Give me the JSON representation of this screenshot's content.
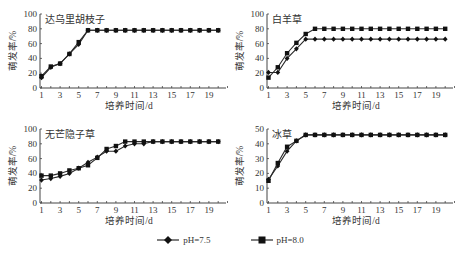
{
  "chart_data": [
    {
      "type": "line",
      "title": "达乌里胡枝子",
      "xlabel": "培养时间/d",
      "ylabel": "萌发率/%",
      "x": [
        1,
        2,
        3,
        4,
        5,
        6,
        7,
        8,
        9,
        10,
        11,
        12,
        13,
        14,
        15,
        16,
        17,
        18,
        19,
        20
      ],
      "xticks": [
        1,
        3,
        5,
        7,
        9,
        11,
        13,
        15,
        17,
        19
      ],
      "yticks": [
        0,
        20,
        40,
        60,
        80,
        100
      ],
      "ylim": [
        0,
        100
      ],
      "series": [
        {
          "name": "pH=7.5",
          "marker": "diamond",
          "values": [
            14,
            28,
            33,
            46,
            59,
            78,
            78,
            78,
            78,
            78,
            78,
            78,
            78,
            78,
            78,
            78,
            78,
            78,
            78,
            78
          ]
        },
        {
          "name": "pH=8.0",
          "marker": "square",
          "values": [
            16,
            29,
            33,
            46,
            62,
            78,
            78,
            78,
            78,
            78,
            78,
            78,
            78,
            78,
            78,
            78,
            78,
            78,
            78,
            78
          ]
        }
      ]
    },
    {
      "type": "line",
      "title": "白羊草",
      "xlabel": "培养时间/d",
      "ylabel": "萌发率/%",
      "x": [
        1,
        2,
        3,
        4,
        5,
        6,
        7,
        8,
        9,
        10,
        11,
        12,
        13,
        14,
        15,
        16,
        17,
        18,
        19,
        20
      ],
      "xticks": [
        1,
        3,
        5,
        7,
        9,
        11,
        13,
        15,
        17,
        19
      ],
      "yticks": [
        0,
        20,
        40,
        60,
        80,
        100
      ],
      "ylim": [
        0,
        100
      ],
      "series": [
        {
          "name": "pH=7.5",
          "marker": "diamond",
          "values": [
            21,
            21,
            40,
            53,
            66,
            66,
            66,
            66,
            66,
            66,
            66,
            66,
            66,
            66,
            66,
            66,
            66,
            66,
            66,
            66
          ]
        },
        {
          "name": "pH=8.0",
          "marker": "square",
          "values": [
            14,
            28,
            47,
            61,
            73,
            80,
            80,
            80,
            80,
            80,
            80,
            80,
            80,
            80,
            80,
            80,
            80,
            80,
            80,
            80
          ]
        }
      ]
    },
    {
      "type": "line",
      "title": "无芒隐子草",
      "xlabel": "培养时间/d",
      "ylabel": "萌发率/%",
      "x": [
        1,
        2,
        3,
        4,
        5,
        6,
        7,
        8,
        9,
        10,
        11,
        12,
        13,
        14,
        15,
        16,
        17,
        18,
        19,
        20
      ],
      "xticks": [
        1,
        3,
        5,
        7,
        9,
        11,
        13,
        15,
        17,
        19
      ],
      "yticks": [
        0,
        20,
        40,
        60,
        80,
        100
      ],
      "ylim": [
        0,
        100
      ],
      "series": [
        {
          "name": "pH=7.5",
          "marker": "diamond",
          "values": [
            31,
            33,
            36,
            40,
            47,
            55,
            62,
            70,
            70,
            77,
            80,
            80,
            83,
            83,
            83,
            83,
            83,
            83,
            83,
            83
          ]
        },
        {
          "name": "pH=8.0",
          "marker": "square",
          "values": [
            37,
            37,
            40,
            44,
            47,
            51,
            61,
            73,
            77,
            83,
            83,
            83,
            83,
            83,
            83,
            83,
            83,
            83,
            83,
            83
          ]
        }
      ]
    },
    {
      "type": "line",
      "title": "冰草",
      "xlabel": "培养时间/d",
      "ylabel": "萌发率/%",
      "x": [
        1,
        2,
        3,
        4,
        5,
        6,
        7,
        8,
        9,
        10,
        11,
        12,
        13,
        14,
        15,
        16,
        17,
        18,
        19,
        20
      ],
      "xticks": [
        1,
        3,
        5,
        7,
        9,
        11,
        13,
        15,
        17,
        19
      ],
      "yticks": [
        0,
        10,
        20,
        30,
        40,
        50
      ],
      "ylim": [
        0,
        50
      ],
      "series": [
        {
          "name": "pH=7.5",
          "marker": "diamond",
          "values": [
            16,
            25,
            35,
            42,
            46,
            46,
            46,
            46,
            46,
            46,
            46,
            46,
            46,
            46,
            46,
            46,
            46,
            46,
            46,
            46
          ]
        },
        {
          "name": "pH=8.0",
          "marker": "square",
          "values": [
            15,
            27,
            38,
            42,
            46,
            46,
            46,
            46,
            46,
            46,
            46,
            46,
            46,
            46,
            46,
            46,
            46,
            46,
            46,
            46
          ]
        }
      ]
    }
  ],
  "legend": {
    "items": [
      {
        "label": "pH=7.5",
        "marker": "diamond"
      },
      {
        "label": "pH=8.0",
        "marker": "square"
      }
    ]
  },
  "colors": {
    "line": "#2a2a2a",
    "axis": "#444444",
    "text": "#333333"
  }
}
